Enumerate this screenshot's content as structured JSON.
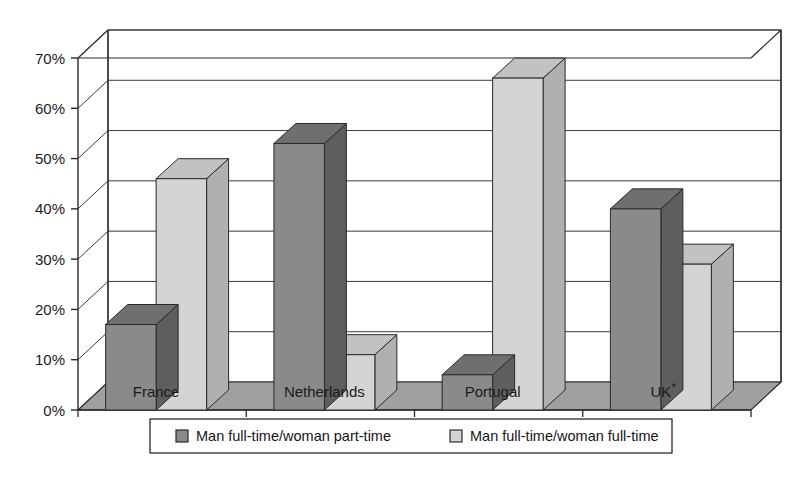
{
  "chart_data": {
    "type": "bar",
    "title": "",
    "subtitle": "",
    "xlabel": "",
    "ylabel": "",
    "categories": [
      "France",
      "Netherlands",
      "Portugal",
      "UK*"
    ],
    "series": [
      {
        "name": "Man full-time/woman part-time",
        "values": [
          17,
          53,
          7,
          40
        ],
        "color": "#8a8a8a"
      },
      {
        "name": "Man full-time/woman full-time",
        "values": [
          46,
          11,
          66,
          29
        ],
        "color": "#d4d4d4"
      }
    ],
    "ylim": [
      0,
      70
    ],
    "ytick_values": [
      0,
      10,
      20,
      30,
      40,
      50,
      60,
      70
    ],
    "ytick_labels": [
      "0%",
      "10%",
      "20%",
      "30%",
      "40%",
      "50%",
      "60%",
      "70%"
    ],
    "grid": true,
    "grid_axis": "y",
    "legend_position": "bottom",
    "three_d": true,
    "value_suffix": "%",
    "footnote_marker": "*"
  },
  "style": {
    "background": "#ffffff",
    "line_color": "#2a2a2a",
    "floor_color": "#a0a0a0",
    "floor_side_color": "#8d8d8d",
    "wall_color": "#ffffff",
    "gridline_color": "#3a3a3a",
    "series1_front": "#8a8a8a",
    "series1_top": "#6f6f6f",
    "series1_side": "#5e5e5e",
    "series2_front": "#d4d4d4",
    "series2_top": "#c2c2c2",
    "series2_side": "#b0b0b0",
    "legend_border": "#2a2a2a"
  },
  "legend": {
    "items": [
      {
        "label": "Man full-time/woman part-time",
        "swatch": "series1"
      },
      {
        "label": "Man full-time/woman full-time",
        "swatch": "series2"
      }
    ]
  },
  "axis": {
    "y_ticks": [
      {
        "label": "70%",
        "value": 70
      },
      {
        "label": "60%",
        "value": 60
      },
      {
        "label": "50%",
        "value": 50
      },
      {
        "label": "40%",
        "value": 40
      },
      {
        "label": "30%",
        "value": 30
      },
      {
        "label": "20%",
        "value": 20
      },
      {
        "label": "10%",
        "value": 10
      },
      {
        "label": "0%",
        "value": 0
      }
    ],
    "categories": [
      {
        "label": "France",
        "sup": ""
      },
      {
        "label": "Netherlands",
        "sup": ""
      },
      {
        "label": "Portugal",
        "sup": ""
      },
      {
        "label": "UK",
        "sup": "*"
      }
    ]
  }
}
